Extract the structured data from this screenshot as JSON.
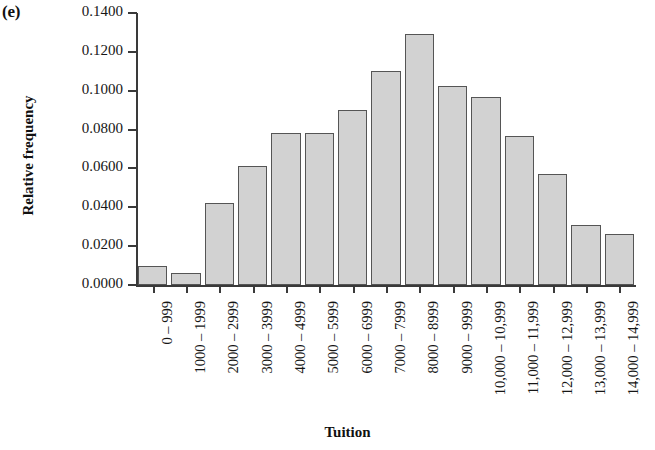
{
  "panel": {
    "label": "(e)"
  },
  "chart_data": {
    "type": "bar",
    "title": "",
    "subtitle": "",
    "xlabel": "Tuition",
    "ylabel": "Relative frequency",
    "ylim": [
      0.0,
      0.14
    ],
    "ytick_labels": [
      "0.0000",
      "0.0200",
      "0.0400",
      "0.0600",
      "0.0800",
      "0.1000",
      "0.1200",
      "0.1400"
    ],
    "ytick_values": [
      0.0,
      0.02,
      0.04,
      0.06,
      0.08,
      0.1,
      0.12,
      0.14
    ],
    "grid": false,
    "legend": false,
    "categories": [
      "0 – 999",
      "1000 – 1999",
      "2000 – 2999",
      "3000 – 3999",
      "4000 – 4999",
      "5000 – 5999",
      "6000 – 6999",
      "7000 – 7999",
      "8000 – 8999",
      "9000 – 9999",
      "10,000 – 10,999",
      "11,000 – 11,999",
      "12,000 – 12,999",
      "13,000 – 13,999",
      "14,000 – 14,999"
    ],
    "values": [
      0.0097,
      0.0062,
      0.042,
      0.0615,
      0.0782,
      0.0782,
      0.09,
      0.11,
      0.129,
      0.1025,
      0.097,
      0.0765,
      0.057,
      0.031,
      0.0265
    ],
    "bar_fill": "#d2d2d2",
    "bar_edge": "#555555",
    "axis_color": "#3a3a3a"
  }
}
